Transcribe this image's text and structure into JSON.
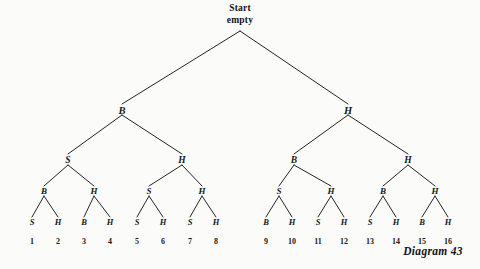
{
  "figure": {
    "caption": "Diagram 43",
    "root_line1": "Start",
    "root_line2": "empty"
  },
  "chart_data": {
    "type": "diagram",
    "title": "Diagram 43",
    "root": "Start empty",
    "levels": [
      {
        "level": 1,
        "labels": [
          "Start empty"
        ]
      },
      {
        "level": 2,
        "labels": [
          "B",
          "H"
        ]
      },
      {
        "level": 3,
        "labels": [
          "S",
          "H",
          "B",
          "H"
        ]
      },
      {
        "level": 4,
        "labels": [
          "B",
          "H",
          "S",
          "H",
          "S",
          "H",
          "B",
          "H"
        ]
      },
      {
        "level": 5,
        "labels": [
          "S",
          "H",
          "B",
          "H",
          "S",
          "H",
          "B",
          "H",
          "B",
          "H",
          "S",
          "H",
          "S",
          "H",
          "B",
          "H"
        ]
      }
    ],
    "leaf_numbers": [
      "1",
      "2",
      "3",
      "4",
      "5",
      "6",
      "7",
      "8",
      "9",
      "10",
      "11",
      "12",
      "13",
      "14",
      "15",
      "16"
    ]
  },
  "nodes": {
    "root": {
      "label_1": "Start",
      "label_2": "empty",
      "x": 240,
      "y": 8
    },
    "level2": [
      {
        "label": "B",
        "x": 122,
        "y": 110
      },
      {
        "label": "H",
        "x": 348,
        "y": 110
      }
    ],
    "level3": [
      {
        "label": "S",
        "x": 68,
        "y": 160
      },
      {
        "label": "H",
        "x": 182,
        "y": 160
      },
      {
        "label": "B",
        "x": 294,
        "y": 160
      },
      {
        "label": "H",
        "x": 408,
        "y": 160
      }
    ],
    "level4": [
      {
        "label": "B",
        "x": 44,
        "y": 191
      },
      {
        "label": "H",
        "x": 94,
        "y": 191
      },
      {
        "label": "S",
        "x": 149,
        "y": 191
      },
      {
        "label": "H",
        "x": 202,
        "y": 191
      },
      {
        "label": "S",
        "x": 279,
        "y": 191
      },
      {
        "label": "H",
        "x": 331,
        "y": 191
      },
      {
        "label": "B",
        "x": 383,
        "y": 191
      },
      {
        "label": "H",
        "x": 435,
        "y": 191
      }
    ],
    "leaves": [
      {
        "label": "S",
        "number": "1",
        "x": 32,
        "y": 222
      },
      {
        "label": "H",
        "number": "2",
        "x": 58,
        "y": 222
      },
      {
        "label": "B",
        "number": "3",
        "x": 84,
        "y": 222
      },
      {
        "label": "H",
        "number": "4",
        "x": 110,
        "y": 222
      },
      {
        "label": "S",
        "number": "5",
        "x": 137,
        "y": 222
      },
      {
        "label": "H",
        "number": "6",
        "x": 163,
        "y": 222
      },
      {
        "label": "S",
        "number": "7",
        "x": 190,
        "y": 222
      },
      {
        "label": "H",
        "number": "8",
        "x": 216,
        "y": 222
      },
      {
        "label": "B",
        "number": "9",
        "x": 266,
        "y": 222
      },
      {
        "label": "H",
        "number": "10",
        "x": 292,
        "y": 222
      },
      {
        "label": "S",
        "number": "11",
        "x": 318,
        "y": 222
      },
      {
        "label": "H",
        "number": "12",
        "x": 344,
        "y": 222
      },
      {
        "label": "S",
        "number": "13",
        "x": 370,
        "y": 222
      },
      {
        "label": "H",
        "number": "14",
        "x": 396,
        "y": 222
      },
      {
        "label": "B",
        "number": "15",
        "x": 422,
        "y": 222
      },
      {
        "label": "H",
        "number": "16",
        "x": 448,
        "y": 222
      }
    ],
    "numbers_y": 241,
    "caption_pos": {
      "x": 433,
      "y": 251
    }
  },
  "style": {
    "line_color": "#23232a",
    "text_color": "#16161a",
    "background": "#fbfbfa"
  }
}
